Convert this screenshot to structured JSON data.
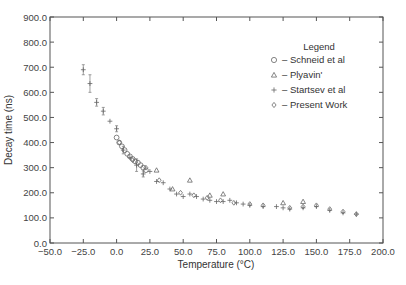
{
  "chart_data": {
    "type": "scatter",
    "title": "",
    "xlabel": "Temperature (°C)",
    "ylabel": "Decay time (ns)",
    "xlim": [
      -50,
      200
    ],
    "ylim": [
      0,
      900
    ],
    "x_ticks": [
      "-50.0",
      "-25.0",
      "0.0",
      "25.0",
      "50.0",
      "75.0",
      "100.0",
      "125.0",
      "150.0",
      "175.0",
      "200.0"
    ],
    "y_ticks": [
      "0.0",
      "100.0",
      "200.0",
      "300.0",
      "400.0",
      "500.0",
      "600.0",
      "700.0",
      "800.0",
      "900.0"
    ],
    "grid": false,
    "legend": {
      "title": "Legend",
      "position": "upper right",
      "entries": [
        {
          "marker": "circle",
          "label": "– Schneid et al"
        },
        {
          "marker": "triangle",
          "label": "– Plyavin'"
        },
        {
          "marker": "plus",
          "label": "– Startsev et al"
        },
        {
          "marker": "diamond",
          "label": "– Present Work"
        }
      ]
    },
    "series": [
      {
        "name": "Schneid et al",
        "marker": "circle",
        "x": [
          0,
          2,
          4,
          6,
          8,
          10,
          12,
          14,
          16,
          18,
          20,
          22
        ],
        "y": [
          420,
          400,
          385,
          370,
          355,
          345,
          335,
          325,
          320,
          310,
          300,
          290
        ]
      },
      {
        "name": "Plyavin'",
        "marker": "triangle",
        "x": [
          30,
          42,
          55,
          70,
          80,
          125,
          140
        ],
        "y": [
          290,
          215,
          250,
          190,
          195,
          160,
          165
        ]
      },
      {
        "name": "Startsev et al",
        "marker": "plus",
        "x": [
          -25,
          -20,
          -15,
          -10,
          -5,
          0,
          5,
          10,
          15,
          20,
          25,
          30,
          35,
          40,
          45,
          50,
          55,
          60,
          65,
          70,
          75,
          80,
          85,
          90,
          95,
          100,
          110,
          120,
          125,
          130,
          140,
          150,
          160,
          170,
          180
        ],
        "y": [
          690,
          635,
          560,
          525,
          485,
          455,
          370,
          340,
          310,
          275,
          285,
          245,
          240,
          215,
          195,
          185,
          195,
          185,
          175,
          170,
          165,
          165,
          170,
          160,
          155,
          150,
          145,
          145,
          140,
          135,
          140,
          145,
          130,
          120,
          115
        ]
      },
      {
        "name": "Present Work",
        "marker": "diamond",
        "x": [
          2,
          12,
          22,
          32,
          48,
          58,
          68,
          78,
          88,
          100,
          110,
          130,
          140,
          150,
          160,
          170,
          180
        ],
        "y": [
          400,
          330,
          300,
          250,
          200,
          190,
          180,
          170,
          160,
          155,
          150,
          140,
          145,
          150,
          135,
          125,
          115
        ]
      }
    ],
    "error_bar_points": [
      {
        "x": -25,
        "y": 690,
        "err": 20
      },
      {
        "x": -20,
        "y": 635,
        "err": 35
      },
      {
        "x": -15,
        "y": 560,
        "err": 15
      },
      {
        "x": -10,
        "y": 525,
        "err": 15
      },
      {
        "x": 0,
        "y": 455,
        "err": 12
      },
      {
        "x": 5,
        "y": 370,
        "err": 15
      },
      {
        "x": 15,
        "y": 310,
        "err": 25
      },
      {
        "x": 20,
        "y": 275,
        "err": 12
      }
    ]
  }
}
